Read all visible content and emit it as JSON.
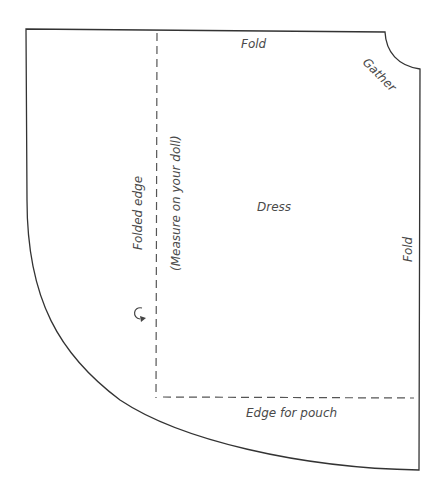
{
  "pattern": {
    "title": "Dress",
    "labels": {
      "top_fold": "Fold",
      "gather": "Gather",
      "right_fold": "Fold",
      "folded_edge": "Folded edge",
      "measure_note": "(Measure on your doll)",
      "piece_name": "Dress",
      "pouch_edge": "Edge for pouch"
    },
    "icons": {
      "fold_arrow": "curved-arrow"
    },
    "colors": {
      "outline": "#333333",
      "dashed": "#555555",
      "text": "#4a4a4a"
    }
  }
}
